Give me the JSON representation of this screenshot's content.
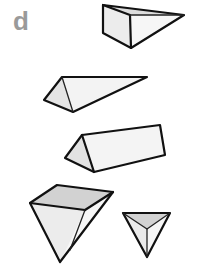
{
  "panel": {
    "label": "d",
    "label_color": "#9a9a9a"
  },
  "colors": {
    "outline": "#111111",
    "face_light": "#f2f2f2",
    "face_mid": "#e2e2e2",
    "face_dark": "#cfcfcf",
    "background": "#ffffff"
  },
  "shapes": [
    {
      "id": "wedge-top",
      "description": "triangular wedge, square face toward viewer-left"
    },
    {
      "id": "thin-wedge",
      "description": "long thin triangular prism pointing right"
    },
    {
      "id": "triangular-prism",
      "description": "horizontal triangular prism"
    },
    {
      "id": "large-pyramid",
      "description": "inverted pyramid with shaded top face"
    },
    {
      "id": "small-tetrahedron",
      "description": "small inverted tetrahedron"
    }
  ]
}
